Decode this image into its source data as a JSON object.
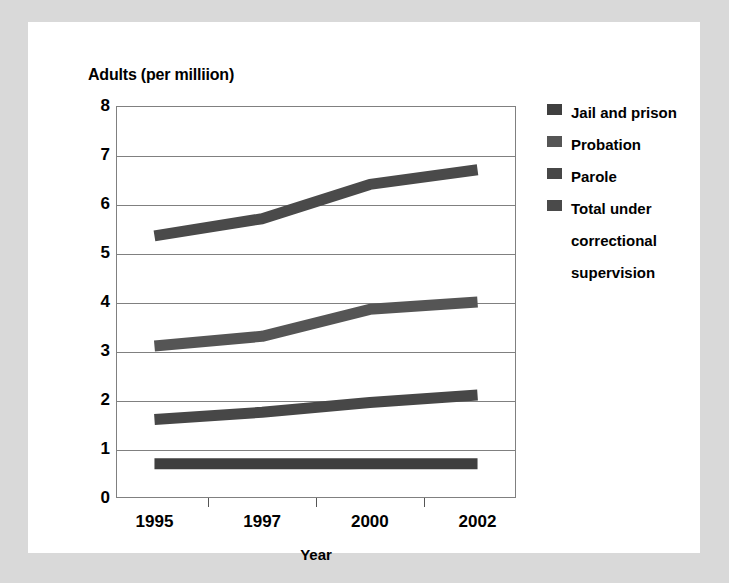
{
  "chart_data": {
    "type": "line",
    "title": "",
    "ylabel": "Adults (per milliion)",
    "xlabel": "Year",
    "categories": [
      "1995",
      "1997",
      "2000",
      "2002"
    ],
    "ylim": [
      0,
      8
    ],
    "y_ticks": [
      "0",
      "1",
      "2",
      "3",
      "4",
      "5",
      "6",
      "7",
      "8"
    ],
    "grid": true,
    "legend_position": "right",
    "series": [
      {
        "name": "Jail and prison",
        "values": [
          0.7,
          0.7,
          0.7,
          0.7
        ],
        "color": "#3f3f3f"
      },
      {
        "name": "Probation",
        "values": [
          3.1,
          3.3,
          3.85,
          4.0
        ],
        "color": "#555555"
      },
      {
        "name": "Parole",
        "values": [
          1.6,
          1.75,
          1.95,
          2.1
        ],
        "color": "#474747"
      },
      {
        "name": "Total under correctional supervision",
        "values": [
          5.35,
          5.7,
          6.4,
          6.7
        ],
        "color": "#4a4a4a"
      }
    ]
  },
  "legend": {
    "entries": [
      {
        "label": "Jail and prison"
      },
      {
        "label": "Probation"
      },
      {
        "label": "Parole"
      },
      {
        "label": "Total under"
      },
      {
        "label": "correctional"
      },
      {
        "label": "supervision"
      }
    ]
  },
  "colors": {
    "page_background": "#d9d9d9",
    "card_background": "#ffffff",
    "axis": "#808080",
    "text": "#000000",
    "line": "#444444"
  }
}
